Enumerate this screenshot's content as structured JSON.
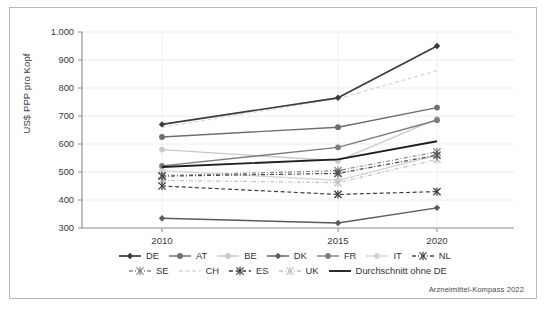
{
  "figure": {
    "source_note": "Arzneimittel-Kompass 2022",
    "y_axis_title": "US$ PPP pro Kopf"
  },
  "chart_data": {
    "type": "line",
    "title": "",
    "subtitle": "",
    "xlabel": "",
    "ylabel": "US$ PPP pro Kopf",
    "x": [
      "2010",
      "2015",
      "2020"
    ],
    "xtick_labels": [
      "2010",
      "2015",
      "2020"
    ],
    "ytick_labels": [
      "300",
      "400",
      "500",
      "600",
      "700",
      "800",
      "900",
      "1.000"
    ],
    "ylim": [
      300,
      1000
    ],
    "ytick_step": 100,
    "grid": "horizontal",
    "legend_position": "bottom",
    "series": [
      {
        "name": "DE",
        "values": [
          670,
          765,
          950
        ],
        "color": "#3a3a3a",
        "dash": "solid",
        "marker": "diamond",
        "width": 1.7
      },
      {
        "name": "AT",
        "values": [
          625,
          660,
          730
        ],
        "color": "#6e6e6e",
        "dash": "solid",
        "marker": "circle",
        "width": 1.4
      },
      {
        "name": "BE",
        "values": [
          580,
          540,
          690
        ],
        "color": "#c9c9c9",
        "dash": "solid",
        "marker": "circle",
        "width": 1.4
      },
      {
        "name": "DK",
        "values": [
          335,
          318,
          372
        ],
        "color": "#5a5a5a",
        "dash": "solid",
        "marker": "diamond",
        "width": 1.4
      },
      {
        "name": "FR",
        "values": [
          522,
          588,
          685
        ],
        "color": "#7d7d7d",
        "dash": "solid",
        "marker": "circle",
        "width": 1.4
      },
      {
        "name": "IT",
        "values": [
          505,
          470,
          560
        ],
        "color": "#d5d5d5",
        "dash": "solid",
        "marker": "circle",
        "width": 1.4
      },
      {
        "name": "NL",
        "values": [
          485,
          495,
          560
        ],
        "color": "#4a4a4a",
        "dash": "dashdot",
        "marker": "star",
        "width": 1.2
      },
      {
        "name": "SE",
        "values": [
          487,
          505,
          572
        ],
        "color": "#8a8a8a",
        "dash": "dashdot",
        "marker": "star",
        "width": 1.2
      },
      {
        "name": "CH",
        "values": [
          660,
          762,
          862
        ],
        "color": "#d8d8d8",
        "dash": "dashed",
        "marker": "none",
        "width": 1.3
      },
      {
        "name": "ES",
        "values": [
          450,
          420,
          430
        ],
        "color": "#3f3f3f",
        "dash": "dashed",
        "marker": "star",
        "width": 1.2
      },
      {
        "name": "UK",
        "values": [
          470,
          462,
          545
        ],
        "color": "#c2c2c2",
        "dash": "dashdot",
        "marker": "star",
        "width": 1.2
      },
      {
        "name": "Durchschnitt ohne DE",
        "values": [
          518,
          545,
          610
        ],
        "color": "#1f1f1f",
        "dash": "solid",
        "marker": "none",
        "width": 1.9
      }
    ]
  },
  "legend": {
    "rows": [
      [
        "DE",
        "AT",
        "BE",
        "DK",
        "FR",
        "IT",
        "NL"
      ],
      [
        "SE",
        "CH",
        "ES",
        "UK",
        "Durchschnitt ohne DE"
      ]
    ]
  }
}
